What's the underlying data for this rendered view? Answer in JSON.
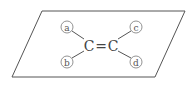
{
  "diagram": {
    "plane": "parallelogram",
    "atoms": [
      {
        "id": "C1",
        "label": "C"
      },
      {
        "id": "C2",
        "label": "C"
      }
    ],
    "bond": {
      "type": "double",
      "symbol": "="
    },
    "substituents": [
      {
        "label": "a",
        "position": "upper-left",
        "bonded_to": "C1"
      },
      {
        "label": "b",
        "position": "lower-left",
        "bonded_to": "C1"
      },
      {
        "label": "c",
        "position": "upper-right",
        "bonded_to": "C2"
      },
      {
        "label": "d",
        "position": "lower-right",
        "bonded_to": "C2"
      }
    ],
    "colors": {
      "line": "#555555",
      "text": "#444444"
    }
  }
}
